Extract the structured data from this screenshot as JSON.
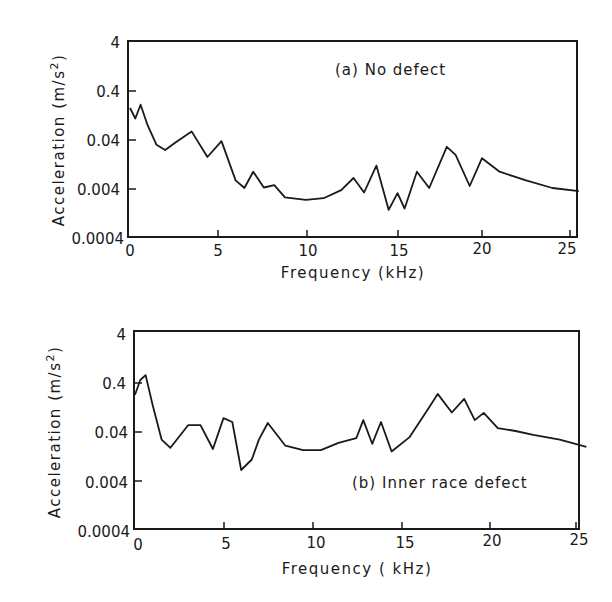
{
  "chart_data": [
    {
      "type": "line",
      "title": "(a) No defect",
      "xlabel": "Frequency (kHz)",
      "ylabel": "Acceleration (m/s²)",
      "yscale": "log",
      "xlim": [
        0,
        25.5
      ],
      "ylim": [
        0.0004,
        4
      ],
      "xticks": [
        0,
        5,
        10,
        15,
        20,
        25
      ],
      "yticks": [
        0.0004,
        0.004,
        0.04,
        0.4,
        4
      ],
      "ytick_labels": [
        "0.0004",
        "0.004",
        "0.04",
        "0.4",
        "4"
      ],
      "grid": false,
      "legend": null,
      "series": [
        {
          "name": "No defect",
          "x": [
            0.0,
            0.3,
            0.6,
            1.0,
            1.5,
            2.0,
            2.6,
            3.5,
            4.4,
            5.2,
            6.0,
            6.5,
            7.0,
            7.6,
            8.2,
            8.8,
            10.0,
            11.0,
            12.0,
            12.7,
            13.3,
            14.0,
            14.7,
            15.2,
            15.6,
            16.3,
            17.0,
            18.0,
            18.5,
            19.3,
            20.0,
            21.0,
            22.5,
            24.0,
            25.5
          ],
          "values": [
            0.18,
            0.11,
            0.21,
            0.08,
            0.032,
            0.025,
            0.036,
            0.06,
            0.018,
            0.038,
            0.006,
            0.0042,
            0.009,
            0.0043,
            0.0048,
            0.0027,
            0.0024,
            0.0026,
            0.0038,
            0.0067,
            0.0034,
            0.012,
            0.0015,
            0.0033,
            0.0016,
            0.009,
            0.0042,
            0.029,
            0.02,
            0.0046,
            0.017,
            0.009,
            0.006,
            0.0042,
            0.0036
          ]
        }
      ]
    },
    {
      "type": "line",
      "title": "(b) Inner race defect",
      "xlabel": "Frequency (kHz)",
      "ylabel": "Acceleration (m/s²)",
      "yscale": "log",
      "xlim": [
        0,
        25.5
      ],
      "ylim": [
        0.0004,
        4
      ],
      "xticks": [
        0,
        5,
        10,
        15,
        20,
        25
      ],
      "yticks": [
        0.0004,
        0.004,
        0.04,
        0.4,
        4
      ],
      "ytick_labels": [
        "0.0004",
        "0.004",
        "0.04",
        "0.4",
        "4"
      ],
      "grid": false,
      "legend": null,
      "series": [
        {
          "name": "Inner race defect",
          "x": [
            0.0,
            0.3,
            0.6,
            1.0,
            1.5,
            2.0,
            3.0,
            3.7,
            4.4,
            5.0,
            5.5,
            6.0,
            6.6,
            7.0,
            7.5,
            8.5,
            9.5,
            10.5,
            11.5,
            12.5,
            12.9,
            13.4,
            13.9,
            14.5,
            15.5,
            16.5,
            17.1,
            17.9,
            18.6,
            19.2,
            19.7,
            20.5,
            21.5,
            22.5,
            24.0,
            25.5
          ],
          "values": [
            0.23,
            0.46,
            0.58,
            0.14,
            0.028,
            0.019,
            0.055,
            0.055,
            0.018,
            0.077,
            0.064,
            0.0067,
            0.011,
            0.028,
            0.061,
            0.021,
            0.017,
            0.017,
            0.024,
            0.03,
            0.07,
            0.023,
            0.064,
            0.016,
            0.031,
            0.11,
            0.24,
            0.1,
            0.19,
            0.07,
            0.098,
            0.048,
            0.042,
            0.035,
            0.028,
            0.02
          ]
        }
      ]
    }
  ],
  "panels": [
    {
      "label": "(a) No defect",
      "xlabel": "Frequency (kHz)",
      "ylabel_main": "Acceleration (m/s",
      "ylabel_sup": "2",
      "ylabel_close": ")",
      "xtick_labels": [
        "0",
        "5",
        "10",
        "15",
        "20",
        "25"
      ],
      "ytick_labels": [
        "4",
        "0.4",
        "0.04",
        "0.004",
        "0.0004"
      ]
    },
    {
      "label": "(b) Inner race defect",
      "xlabel": "Frequency ( kHz)",
      "ylabel_main": "Acceleration (m/s",
      "ylabel_sup": "2",
      "ylabel_close": ")",
      "xtick_labels": [
        "0",
        "5",
        "10",
        "15",
        "20",
        "25"
      ],
      "ytick_labels": [
        "4",
        "0.4",
        "0.04",
        "0.004",
        "0.0004"
      ]
    }
  ],
  "colors": {
    "ink": "#1a1a1a",
    "background": "#ffffff"
  }
}
